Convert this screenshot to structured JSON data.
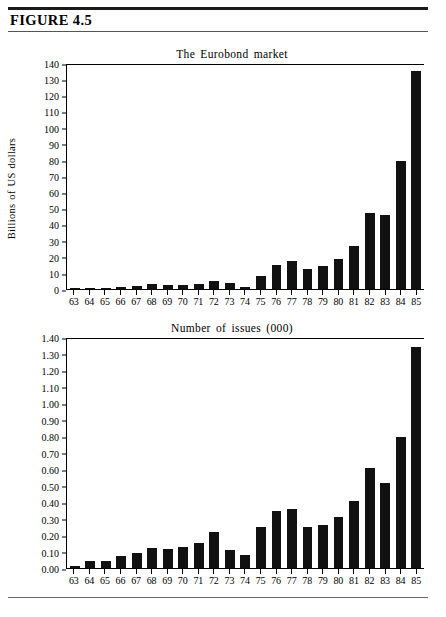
{
  "figure": {
    "label": "FIGURE 4.5"
  },
  "chart_data": [
    {
      "id": "eurobond-market-value",
      "type": "bar",
      "title": "The Eurobond market",
      "xlabel": "",
      "ylabel": "Billions of US dollars",
      "ylim": [
        0,
        140
      ],
      "ytick_step": 10,
      "grid": false,
      "legend": "none",
      "categories": [
        "63",
        "64",
        "65",
        "66",
        "67",
        "68",
        "69",
        "70",
        "71",
        "72",
        "73",
        "74",
        "75",
        "76",
        "77",
        "78",
        "79",
        "80",
        "81",
        "82",
        "83",
        "84",
        "85"
      ],
      "ytick_labels": [
        "0",
        "10",
        "20",
        "30",
        "40",
        "50",
        "60",
        "70",
        "80",
        "90",
        "100",
        "110",
        "120",
        "130",
        "140"
      ],
      "values": [
        0.2,
        0.7,
        0.7,
        1.0,
        1.8,
        3.0,
        2.5,
        2.8,
        3.3,
        5.2,
        3.6,
        1.3,
        8.2,
        15.0,
        17.5,
        12.3,
        14.5,
        18.9,
        26.8,
        47.5,
        46.3,
        79.5,
        136.0
      ]
    },
    {
      "id": "eurobond-number-of-issues",
      "type": "bar",
      "title": "Number of issues (000)",
      "xlabel": "",
      "ylabel": "",
      "ylim": [
        0,
        1.4
      ],
      "ytick_step": 0.1,
      "grid": false,
      "legend": "none",
      "categories": [
        "63",
        "64",
        "65",
        "66",
        "67",
        "68",
        "69",
        "70",
        "71",
        "72",
        "73",
        "74",
        "75",
        "76",
        "77",
        "78",
        "79",
        "80",
        "81",
        "82",
        "83",
        "84",
        "85"
      ],
      "ytick_labels": [
        "0.00",
        "0.10",
        "0.20",
        "0.30",
        "0.40",
        "0.50",
        "0.60",
        "0.70",
        "0.80",
        "0.90",
        "1.00",
        "1.10",
        "1.20",
        "1.30",
        "1.40"
      ],
      "values": [
        0.015,
        0.042,
        0.042,
        0.072,
        0.09,
        0.125,
        0.118,
        0.127,
        0.152,
        0.22,
        0.112,
        0.08,
        0.25,
        0.345,
        0.36,
        0.25,
        0.263,
        0.31,
        0.41,
        0.61,
        0.52,
        0.8,
        1.35
      ]
    }
  ],
  "colors": {
    "bar": "#111111",
    "axis": "#000000",
    "rule": "#1a1a1a",
    "background": "#ffffff"
  }
}
